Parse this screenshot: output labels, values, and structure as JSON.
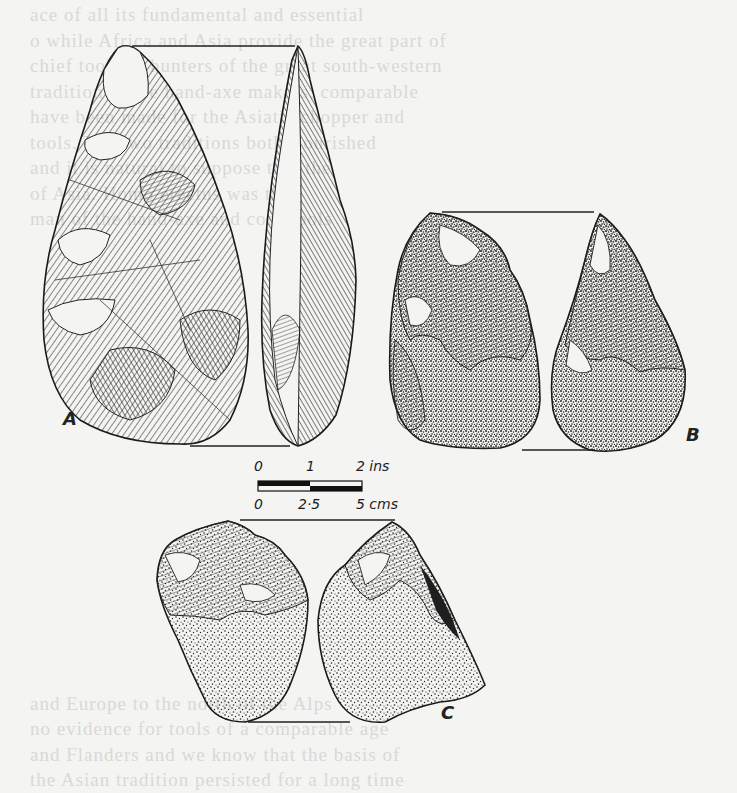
{
  "page": {
    "type": "scanned book page illustration",
    "background_color": "#f4f4f2",
    "ink_color": "#1e1e1e"
  },
  "figure": {
    "labels": {
      "a": "A",
      "b": "B",
      "c": "C"
    },
    "items": [
      {
        "label": "A",
        "description": "Hand axe, front and side views, flaked surface"
      },
      {
        "label": "B",
        "description": "Chopping tool, front and side views, cortex stippled"
      },
      {
        "label": "C",
        "description": "Chopper, front and side views, cortex stippled"
      }
    ],
    "scale_bar": {
      "top_row": [
        "0",
        "1",
        "2 ins"
      ],
      "bottom_row": [
        "0",
        "2·5",
        "5 cms"
      ]
    }
  },
  "bleed_through_text": [
    "  ace of all its fundamental and essential",
    "o while Africa and Asia provide the great part of",
    "  chief tools of hunters of the great south-western",
    "  tradition of the hand-axe makers, comparable",
    "  have been made for the Asiatic chopper and",
    "  tools. The two traditions both flourished",
    "  and it is natural to suppose that the",
    "  of Asia. Homo erectus was the",
    "  man of the hand-axe and core-tools",
    "",
    "",
    "",
    "",
    "",
    "",
    "",
    "",
    "",
    "",
    "",
    "",
    "",
    "",
    "",
    "",
    "",
    "",
    "  and Europe to the north of the Alps",
    "  no evidence for tools of a comparable age",
    "  and Flanders and we know that the basis of",
    "  the Asian tradition persisted for a long time"
  ]
}
